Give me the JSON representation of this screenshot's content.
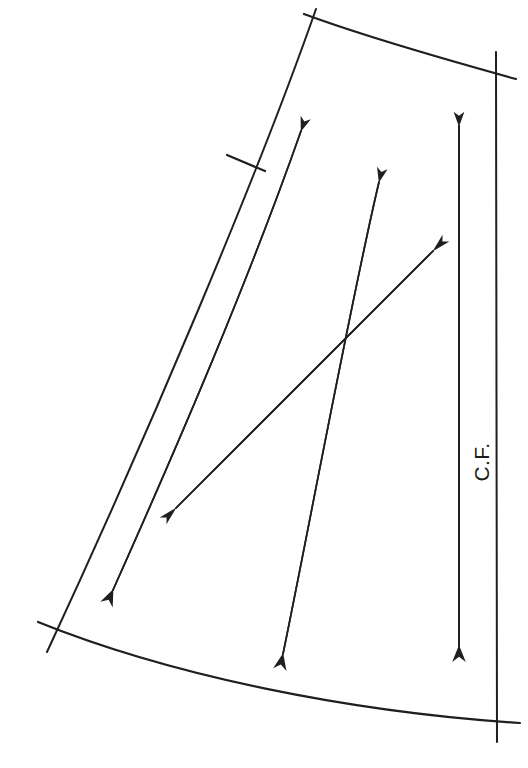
{
  "figure": {
    "background_color": "#ffffff",
    "ink_color": "#1f1f1f",
    "width": 528,
    "height": 768
  },
  "labels": {
    "center_front": "C.F."
  },
  "outline": {
    "left_edge": {
      "name": "left-edge-seamline",
      "path": "M 316 9 C 258 175, 150 430, 47 652",
      "stroke_width": 2.0
    },
    "top_edge": {
      "name": "top-edge-curve",
      "path": "M 309 17 C 360 35, 440 58, 513 78",
      "stroke_width": 2.2
    },
    "bottom_edge": {
      "name": "bottom-edge-curve",
      "path": "M 43 624 C 175 676, 350 712, 512 722",
      "stroke_width": 2.2
    },
    "right_edge": {
      "name": "right-edge-straight",
      "path": "M 497 53 L 497 741",
      "stroke_width": 2.0
    },
    "notch_left": {
      "name": "notch-mark-left-edge",
      "path": "M 228 157 L 263 170",
      "stroke_width": 2.2
    }
  },
  "arrows": [
    {
      "name": "arrow-outer-long-up",
      "direction": "up-right",
      "head": "single",
      "path": "M 111 596 C 180 442, 250 280, 304 126",
      "stroke_width": 1.7
    },
    {
      "name": "arrow-outer-long-down",
      "direction": "down-left",
      "head": "single",
      "path": "M 304 126 C 250 280, 180 442, 111 596",
      "stroke_width": 1.7
    },
    {
      "name": "arrow-center-up",
      "direction": "up-right",
      "head": "single",
      "path": "M 281 660 C 310 530, 350 300, 381 177",
      "stroke_width": 1.7
    },
    {
      "name": "arrow-center-down",
      "direction": "down-left",
      "head": "single",
      "path": "M 381 177 C 350 300, 310 530, 281 660",
      "stroke_width": 1.7
    },
    {
      "name": "arrow-bias-up-right",
      "direction": "up-right",
      "head": "single",
      "path": "M 171 512 L 437 247",
      "stroke_width": 1.7
    },
    {
      "name": "arrow-bias-down-left",
      "direction": "down-left",
      "head": "single",
      "path": "M 437 247 L 171 512",
      "stroke_width": 1.7
    },
    {
      "name": "arrow-grainline-center-front",
      "direction": "vertical-double",
      "head": "double",
      "path": "M 459 120 L 459 652",
      "stroke_width": 1.9
    }
  ],
  "grainline": {
    "name": "center-front-grainline",
    "label": "C.F.",
    "label_rotation_deg": -90,
    "label_x": 478,
    "label_y": 455,
    "top_y": 113,
    "bottom_y": 658,
    "x": 459
  }
}
